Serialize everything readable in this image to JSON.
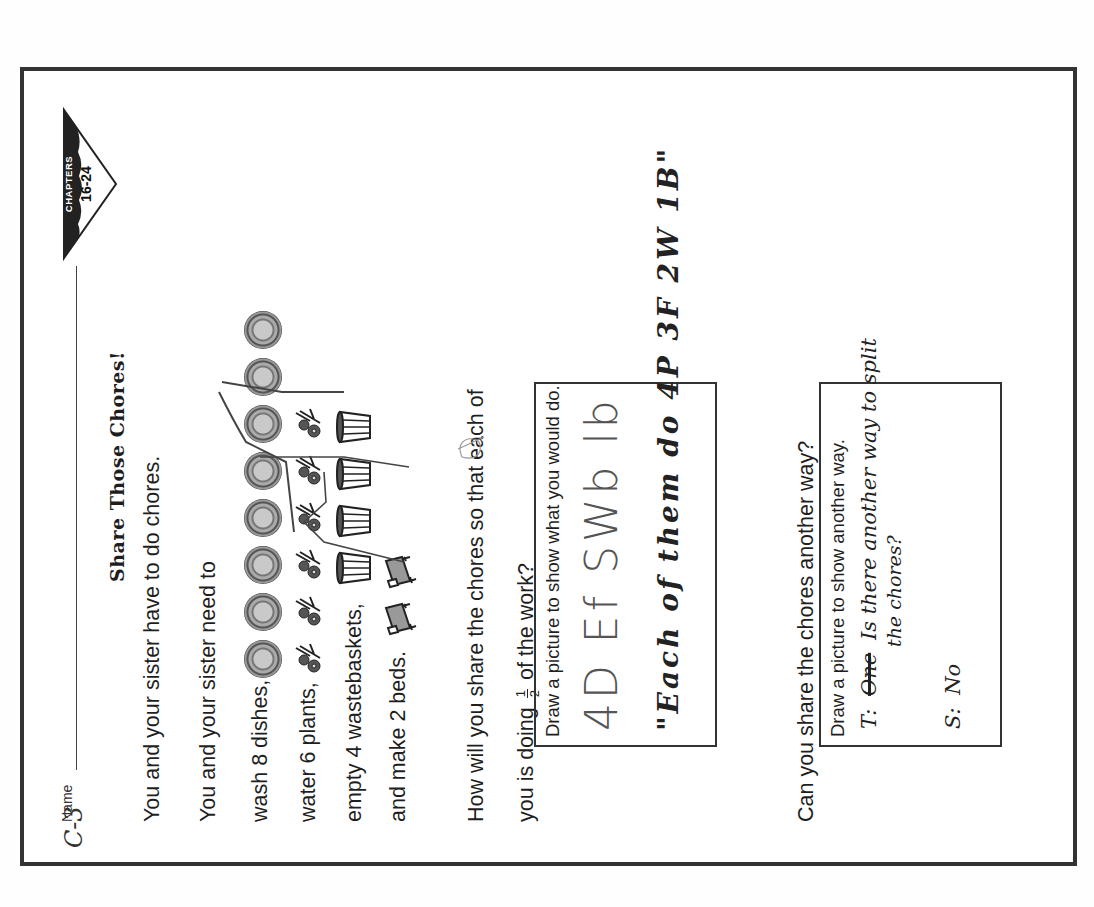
{
  "worksheet": {
    "corner_annotation": "C-3",
    "name_label": "Name",
    "chapter_tag": {
      "label": "CHAPTERS",
      "range": "16-24"
    },
    "title": "Share Those Chores!",
    "intro": "You and your sister have to do chores.",
    "task_intro": "You and your sister need to",
    "chores": [
      {
        "text": "wash 8 dishes,",
        "icon": "dish-icon",
        "count": 8
      },
      {
        "text": "water 6 plants,",
        "icon": "plant-icon",
        "count": 6
      },
      {
        "text": "empty 4 wastebaskets,",
        "icon": "wastebasket-icon",
        "count": 4
      },
      {
        "text": "and make 2 beds.",
        "icon": "bed-icon",
        "count": 2
      }
    ],
    "question": {
      "line1": "How will you share the chores so that each of",
      "line2_before": "you is doing",
      "fraction_numerator": "1",
      "fraction_denominator": "2",
      "line2_after": "of the work?"
    },
    "box1": {
      "prompt": "Draw a picture to show what you would do.",
      "handwriting_line1": "4D   Ef   SWb  lb",
      "handwriting_line2": "\"Each of them do  4P 3F 2W 1B\""
    },
    "question2": "Can you share the chores another way?",
    "box2": {
      "prompt": "Draw a picture to show another way.",
      "teacher_prefix": "T:",
      "teacher_text": "Is there another way to split",
      "teacher_text_line2": "the chores?",
      "student_prefix": "S:",
      "student_text": "No"
    }
  }
}
